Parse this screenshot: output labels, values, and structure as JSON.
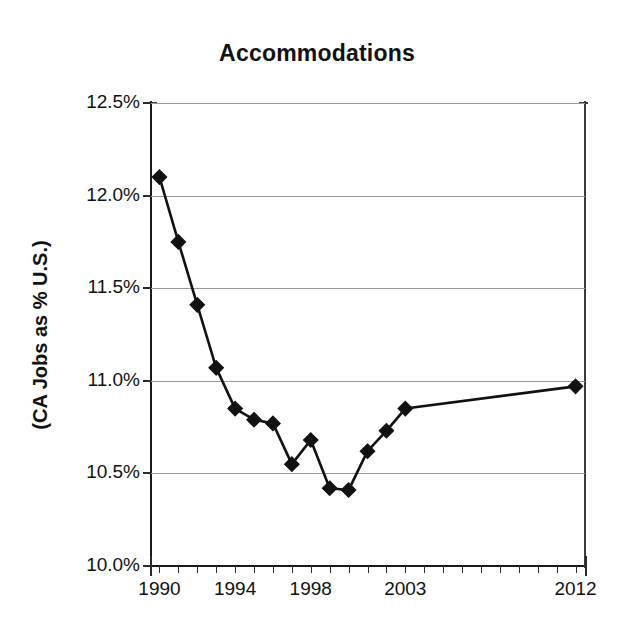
{
  "chart_data": {
    "type": "line",
    "title": "Accommodations",
    "xlabel": "",
    "ylabel": "(CA Jobs as % U.S.)",
    "ylim": [
      10.0,
      12.5
    ],
    "xlim": [
      1989.5,
      2012.5
    ],
    "grid": true,
    "legend": null,
    "y_ticks": [
      "10.0%",
      "10.5%",
      "11.0%",
      "11.5%",
      "12.0%",
      "12.5%"
    ],
    "y_tick_values": [
      10.0,
      10.5,
      11.0,
      11.5,
      12.0,
      12.5
    ],
    "x_tick_labels": [
      "1990",
      "1994",
      "1998",
      "2003",
      "2012"
    ],
    "x_tick_values": [
      1990,
      1994,
      1998,
      2003,
      2012
    ],
    "marker": "diamond",
    "marker_color": "#111111",
    "line_color": "#111111",
    "x": [
      1990,
      1991,
      1992,
      1993,
      1994,
      1995,
      1996,
      1997,
      1998,
      1999,
      2000,
      2001,
      2002,
      2003,
      2012
    ],
    "values": [
      12.1,
      11.75,
      11.41,
      11.07,
      10.85,
      10.79,
      10.77,
      10.55,
      10.68,
      10.42,
      10.41,
      10.62,
      10.73,
      10.85,
      10.97
    ],
    "series": [
      {
        "name": "CA Jobs as % U.S.",
        "values": [
          12.1,
          11.75,
          11.41,
          11.07,
          10.85,
          10.79,
          10.77,
          10.55,
          10.68,
          10.42,
          10.41,
          10.62,
          10.73,
          10.85,
          10.97
        ]
      }
    ]
  },
  "chart": {
    "title": "Accommodations",
    "y_axis_title": "(CA Jobs as % U.S.)"
  }
}
